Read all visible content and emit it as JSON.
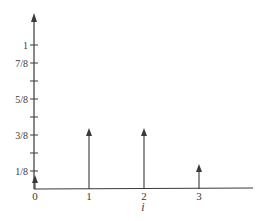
{
  "chart_data": {
    "type": "bar",
    "style": "stem-arrows",
    "title": "",
    "xlabel": "i",
    "ylabel": "",
    "categories": [
      "0",
      "1",
      "2",
      "3"
    ],
    "x": [
      0,
      1,
      2,
      3
    ],
    "values": [
      0.125,
      0.375,
      0.375,
      0.125
    ],
    "y_tick_labels": [
      "1/8",
      "3/8",
      "5/8",
      "7/8",
      "1"
    ],
    "y_tick_values": [
      0.125,
      0.25,
      0.375,
      0.5,
      0.625,
      0.75,
      0.875,
      1
    ],
    "x_tick_labels": [
      "0",
      "1",
      "2",
      "3"
    ],
    "ylim": [
      0,
      1.1
    ],
    "xlim": [
      0,
      4
    ],
    "grid": false,
    "legend": null
  },
  "colors": {
    "axis": "#3a3a3a",
    "stem": "#3a3a3a",
    "background": "#ffffff"
  }
}
